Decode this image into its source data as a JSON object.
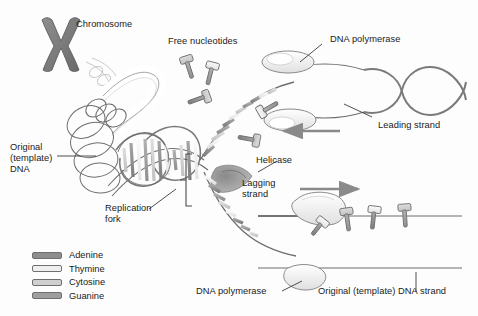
{
  "diagram": {
    "title": "DNA Replication",
    "background": "#fdfdfd",
    "ink": "#1b1b1b"
  },
  "labels": {
    "chromosome": "Chromosome",
    "free_nucleotides": "Free nucleotides",
    "dna_polymerase_top": "DNA polymerase",
    "leading_strand": "Leading strand",
    "helicase": "Helicase",
    "lagging_strand": "Lagging\nstrand",
    "original_template_dna": "Original\n(template)\nDNA",
    "replication_fork": "Replication\nfork",
    "dna_polymerase_bottom": "DNA polymerase",
    "original_template_dna_strand": "Original (template) DNA strand"
  },
  "legend": {
    "items": [
      {
        "name": "Adenine",
        "color": "#8d8d8d"
      },
      {
        "name": "Thymine",
        "color": "#efefef"
      },
      {
        "name": "Cytosine",
        "color": "#cfcfcf"
      },
      {
        "name": "Guanine",
        "color": "#9e9e9e"
      }
    ]
  },
  "arrows": {
    "leading_direction": "left",
    "lagging_direction": "right"
  },
  "palette": {
    "adenine": "#8d8d8d",
    "thymine": "#efefef",
    "cytosine": "#cfcfcf",
    "guanine": "#9e9e9e",
    "chromosome": "#7a7a7a",
    "helicase": "#9a9a9a",
    "outline": "#4a4a4a",
    "backbone": "#6d6d6d"
  }
}
